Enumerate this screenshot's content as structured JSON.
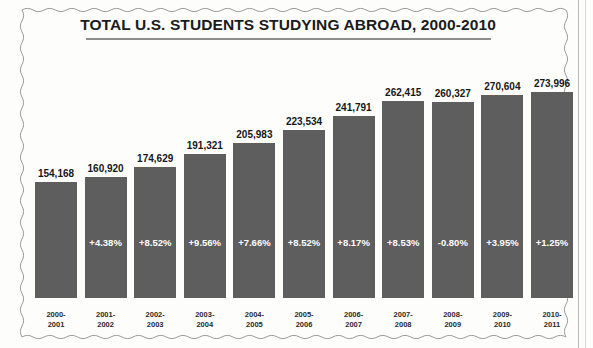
{
  "chart_data": {
    "type": "bar",
    "title": "TOTAL U.S. STUDENTS STUDYING ABROAD, 2000-2010",
    "xlabel": "",
    "ylabel": "",
    "ylim": [
      0,
      290000
    ],
    "grid": false,
    "legend": false,
    "bar_color": "#5e5e5e",
    "categories": [
      "2000-\n2001",
      "2001-\n2002",
      "2002-\n2003",
      "2003-\n2004",
      "2004-\n2005",
      "2005-\n2006",
      "2006-\n2007",
      "2007-\n2008",
      "2008-\n2009",
      "2009-\n2010",
      "2010-\n2011"
    ],
    "values": [
      154168,
      160920,
      174629,
      191321,
      205983,
      223534,
      241791,
      262415,
      260327,
      270604,
      273996
    ],
    "value_labels": [
      "154,168",
      "160,920",
      "174,629",
      "191,321",
      "205,983",
      "223,534",
      "241,791",
      "262,415",
      "260,327",
      "270,604",
      "273,996"
    ],
    "pct_change": [
      null,
      4.38,
      8.52,
      9.56,
      7.66,
      8.52,
      8.17,
      8.53,
      -0.8,
      3.95,
      1.25
    ],
    "pct_labels": [
      "",
      "+4.38%",
      "+8.52%",
      "+9.56%",
      "+7.66%",
      "+8.52%",
      "+8.17%",
      "+8.53%",
      "-0.80%",
      "+3.95%",
      "+1.25%"
    ],
    "cat_line1": [
      "2000-",
      "2001-",
      "2002-",
      "2003-",
      "2004-",
      "2005-",
      "2006-",
      "2007-",
      "2008-",
      "2009-",
      "2010-"
    ],
    "cat_line2": [
      "2001",
      "2002",
      "2003",
      "2004",
      "2005",
      "2006",
      "2007",
      "2008",
      "2009",
      "2010",
      "2011"
    ]
  }
}
